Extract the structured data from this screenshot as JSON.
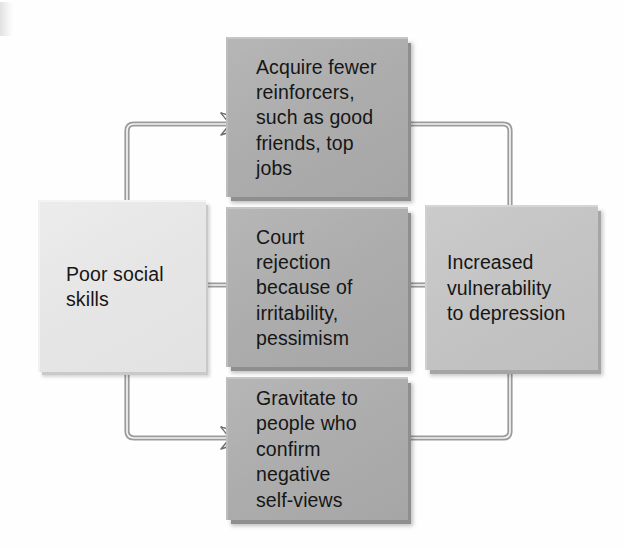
{
  "diagram": {
    "boxes": {
      "source": {
        "label": "Poor social\nskills",
        "fill": "#e6e6e6"
      },
      "reinforcers": {
        "label": "Acquire fewer\nreinforcers,\nsuch as good\nfriends, top\njobs",
        "fill": "#adadad"
      },
      "rejection": {
        "label": "Court\nrejection\nbecause of\nirritability,\npessimism",
        "fill": "#adadad"
      },
      "gravitate": {
        "label": "Gravitate to\npeople who\nconfirm\nnegative\nself-views",
        "fill": "#adadad"
      },
      "outcome": {
        "label": "Increased\nvulnerability\nto depression",
        "fill": "#c4c4c4"
      }
    },
    "connectors": [
      {
        "name": "source-to-reinforcers",
        "from": "source",
        "to": "reinforcers",
        "route": "up-then-right"
      },
      {
        "name": "source-to-rejection",
        "from": "source",
        "to": "rejection",
        "route": "straight-right"
      },
      {
        "name": "source-to-gravitate",
        "from": "source",
        "to": "gravitate",
        "route": "down-then-right"
      },
      {
        "name": "reinforcers-to-outcome",
        "from": "reinforcers",
        "to": "outcome",
        "route": "right-then-down"
      },
      {
        "name": "rejection-to-outcome",
        "from": "rejection",
        "to": "outcome",
        "route": "straight-right"
      },
      {
        "name": "gravitate-to-outcome",
        "from": "gravitate",
        "to": "outcome",
        "route": "right-then-up"
      }
    ],
    "line_color": "#7c7c7c",
    "arrow_fill": "#e9e9e9",
    "arrow_stroke": "#6e6e6e"
  }
}
